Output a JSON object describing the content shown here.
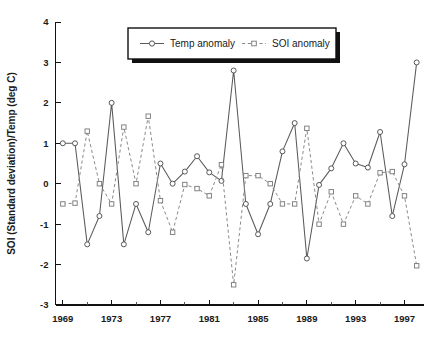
{
  "chart_data": {
    "type": "line",
    "title": "",
    "subtitle": "",
    "xlabel": "",
    "ylabel": "SOI (Standard deviation)/Temp (deg C)",
    "xlim": [
      1968.4,
      1998.6
    ],
    "ylim": [
      -3,
      4
    ],
    "grid": false,
    "legend_position": "top-center",
    "x": [
      1969,
      1970,
      1971,
      1972,
      1973,
      1974,
      1975,
      1976,
      1977,
      1978,
      1979,
      1980,
      1981,
      1982,
      1983,
      1984,
      1985,
      1986,
      1987,
      1988,
      1989,
      1990,
      1991,
      1992,
      1993,
      1994,
      1995,
      1996,
      1997,
      1998
    ],
    "x_tick_labels": [
      "1969",
      "1973",
      "1977",
      "1981",
      "1985",
      "1989",
      "1993",
      "1997"
    ],
    "x_tick_values": [
      1969,
      1973,
      1977,
      1981,
      1985,
      1989,
      1993,
      1997
    ],
    "x_minor_tick_values": [
      1971,
      1975,
      1979,
      1983,
      1987,
      1991,
      1995
    ],
    "y_tick_labels": [
      "4",
      "3",
      "2",
      "1",
      "0",
      "-1",
      "-2",
      "-3"
    ],
    "y_tick_values": [
      4,
      3,
      2,
      1,
      0,
      -1,
      -2,
      -3
    ],
    "series": [
      {
        "name": "Temp anomaly",
        "marker": "circle",
        "linestyle": "solid",
        "color": "#5a5a5a",
        "values": [
          1.0,
          1.0,
          -1.5,
          -0.8,
          2.0,
          -1.5,
          -0.5,
          -1.2,
          0.5,
          0.0,
          0.3,
          0.68,
          0.28,
          0.07,
          2.8,
          -0.5,
          -1.25,
          -0.5,
          0.8,
          1.5,
          -1.85,
          -0.03,
          0.38,
          1.0,
          0.5,
          0.4,
          1.28,
          -0.8,
          0.48,
          3.0
        ]
      },
      {
        "name": "SOI anomaly",
        "marker": "square",
        "linestyle": "dashed",
        "color": "#8a8a8a",
        "values": [
          -0.5,
          -0.48,
          1.3,
          0.0,
          -0.5,
          1.4,
          0.0,
          1.67,
          -0.42,
          -1.2,
          -0.02,
          -0.12,
          -0.3,
          0.47,
          -2.5,
          0.2,
          0.2,
          0.0,
          -0.5,
          -0.5,
          1.37,
          -1.0,
          -0.2,
          -1.0,
          -0.3,
          -0.5,
          0.27,
          0.3,
          -0.3,
          -2.03
        ]
      }
    ]
  },
  "legend": {
    "entries": [
      {
        "label": "Temp anomaly",
        "marker": "circle",
        "linestyle": "solid"
      },
      {
        "label": "SOI anomaly",
        "marker": "square",
        "linestyle": "dashed"
      }
    ]
  },
  "colors": {
    "temp": "#5a5a5a",
    "soi": "#8a8a8a",
    "axis": "#111111",
    "background": "#ffffff",
    "legend_shadow": "#111111"
  },
  "footer": {
    "clipped_text": ""
  }
}
